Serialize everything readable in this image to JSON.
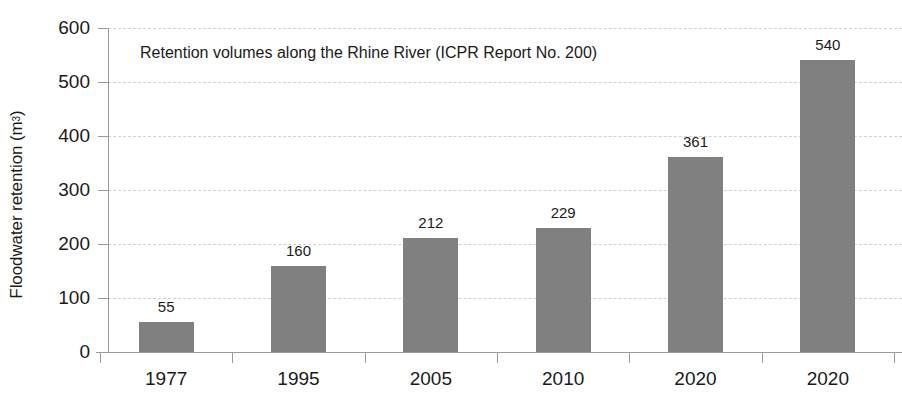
{
  "chart_data": {
    "type": "bar",
    "title": "Retention volumes along the Rhine River (ICPR Report No. 200)",
    "xlabel": "",
    "ylabel": "Floodwater retention (m³)",
    "ylabel_main": "Floodwater retention (m",
    "ylabel_sup": "3",
    "ylabel_tail": ")",
    "categories": [
      "1977",
      "1995",
      "2005",
      "2010",
      "2020",
      "2020"
    ],
    "values": [
      55,
      160,
      212,
      229,
      361,
      540
    ],
    "value_labels": [
      "55",
      "160",
      "212",
      "229",
      "361",
      "540"
    ],
    "ylim": [
      0,
      600
    ],
    "ytick_values": [
      0,
      100,
      200,
      300,
      400,
      500,
      600
    ],
    "ytick_labels": [
      "0",
      "100",
      "200",
      "300",
      "400",
      "500",
      "600"
    ],
    "grid": "horizontal-dashed",
    "legend": "none",
    "bar_color": "#808080",
    "gridline_color": "#d0d0d0",
    "axis_color": "#9a9a9a",
    "text_color": "#1a1a1a",
    "background_color": "#ffffff"
  }
}
